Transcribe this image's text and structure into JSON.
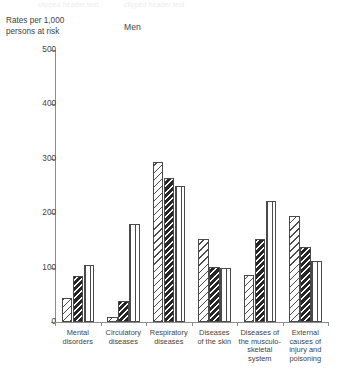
{
  "top_strip": {
    "ghost_left": "clipped header text",
    "ghost_right": "clipped header text"
  },
  "axis_caption": "Rates per 1,000\npersons at risk",
  "chart_data": {
    "type": "bar",
    "title": "Men",
    "xlabel": "",
    "ylabel": "Rates per 1,000 persons at risk",
    "ylim": [
      0,
      500
    ],
    "yticks": [
      0,
      100,
      200,
      300,
      400,
      500
    ],
    "ytick_labels": [
      "0",
      "100",
      "200",
      "300",
      "400",
      "500"
    ],
    "grid": false,
    "legend": "none",
    "categories": [
      "Mental\ndisorders",
      "Circulatory\ndiseases",
      "Respiratory\ndiseases",
      "Diseases\nof the skin",
      "Diseases of\nthe musculo-\nskeletal\nsystem",
      "External\ncauses of\ninjury and\npoisoning"
    ],
    "series": [
      {
        "name": "series-1",
        "pattern": "diagonal-hatch",
        "values": [
          45,
          10,
          295,
          152,
          86,
          195
        ]
      },
      {
        "name": "series-2",
        "pattern": "dense-diagonal-hatch",
        "values": [
          85,
          38,
          265,
          102,
          152,
          137
        ]
      },
      {
        "name": "series-3",
        "pattern": "vertical-lines",
        "values": [
          105,
          180,
          250,
          100,
          222,
          112
        ]
      }
    ]
  }
}
